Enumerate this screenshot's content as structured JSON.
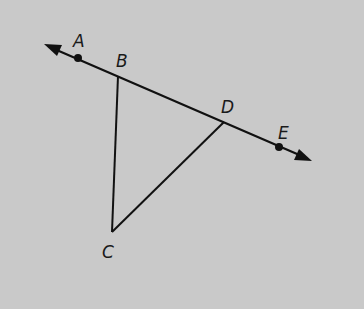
{
  "diagram": {
    "type": "geometry",
    "background": "#c9c9c9",
    "stroke": "#111111",
    "line": {
      "name": "line AE",
      "from": [
        44,
        44
      ],
      "to": [
        312,
        161
      ],
      "arrows": "both"
    },
    "points": [
      {
        "label": "A",
        "x": 78,
        "y": 58,
        "dot": true,
        "label_x": 73,
        "label_y": 47
      },
      {
        "label": "B",
        "x": 118,
        "y": 76,
        "dot": false,
        "label_x": 116,
        "label_y": 67
      },
      {
        "label": "D",
        "x": 224,
        "y": 122,
        "dot": false,
        "label_x": 221,
        "label_y": 113
      },
      {
        "label": "E",
        "x": 279,
        "y": 147,
        "dot": true,
        "label_x": 278,
        "label_y": 139
      },
      {
        "label": "C",
        "x": 112,
        "y": 232,
        "dot": false,
        "label_x": 102,
        "label_y": 258
      }
    ],
    "segments": [
      [
        "B",
        "C"
      ],
      [
        "C",
        "D"
      ]
    ]
  }
}
